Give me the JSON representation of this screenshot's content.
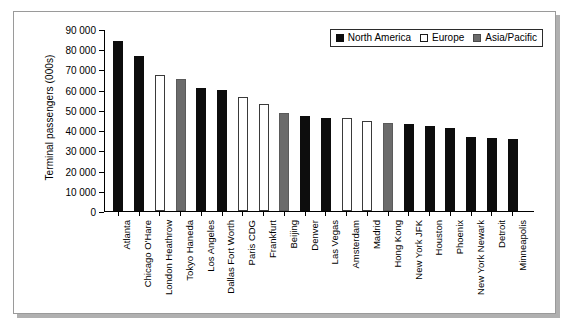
{
  "chart_data": {
    "type": "bar",
    "title": "",
    "xlabel": "",
    "ylabel": "Terminal passengers (000s)",
    "ylim": [
      0,
      90000
    ],
    "ytick_step": 10000,
    "ytick_labels": [
      "90 000",
      "80 000",
      "70 000",
      "60 000",
      "50 000",
      "40 000",
      "30 000",
      "20 000",
      "10 000",
      "0"
    ],
    "grid": false,
    "legend_position": "top-right",
    "categories": [
      "Atlanta",
      "Chicago O'Hare",
      "London Heathrow",
      "Tokyo Haneda",
      "Los Angeles",
      "Dallas Fort Worth",
      "Paris CDG",
      "Frankfurt",
      "Beijing",
      "Denver",
      "Las Vegas",
      "Amsterdam",
      "Madrid",
      "Hong Kong",
      "New York JFK",
      "Houston",
      "Phoenix",
      "New York Newark",
      "Detroit",
      "Minneapolis"
    ],
    "values": [
      84600,
      77200,
      67600,
      65800,
      61000,
      60300,
      56900,
      53000,
      48500,
      47100,
      46200,
      46100,
      45000,
      44000,
      43400,
      42400,
      41300,
      36900,
      36200,
      35700
    ],
    "groups": [
      "North America",
      "North America",
      "Europe",
      "Asia/Pacific",
      "North America",
      "North America",
      "Europe",
      "Europe",
      "Asia/Pacific",
      "North America",
      "North America",
      "Europe",
      "Europe",
      "Asia/Pacific",
      "North America",
      "North America",
      "North America",
      "North America",
      "North America",
      "North America"
    ],
    "legend": [
      {
        "label": "North America",
        "key": "na",
        "color": "#0d0d0d"
      },
      {
        "label": "Europe",
        "key": "eu",
        "color": "#ffffff"
      },
      {
        "label": "Asia/Pacific",
        "key": "ap",
        "color": "#6b6b6b"
      }
    ]
  }
}
